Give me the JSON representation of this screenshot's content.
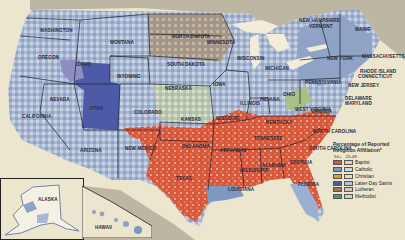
{
  "map": {
    "title": "Religious Affiliation by County",
    "states": [
      {
        "name": "WASHINGTON",
        "x": 40,
        "y": 28
      },
      {
        "name": "OREGON",
        "x": 38,
        "y": 55
      },
      {
        "name": "MONTANA",
        "x": 110,
        "y": 40
      },
      {
        "name": "IDAHO",
        "x": 76,
        "y": 62
      },
      {
        "name": "WYOMING",
        "x": 117,
        "y": 74
      },
      {
        "name": "NEVADA",
        "x": 50,
        "y": 97
      },
      {
        "name": "UTAH",
        "x": 90,
        "y": 106
      },
      {
        "name": "CALIFORNIA",
        "x": 22,
        "y": 114
      },
      {
        "name": "COLORADO",
        "x": 134,
        "y": 110
      },
      {
        "name": "ARIZONA",
        "x": 80,
        "y": 148
      },
      {
        "name": "NEW MEXICO",
        "x": 125,
        "y": 146
      },
      {
        "name": "NORTH DAKOTA",
        "x": 172,
        "y": 34
      },
      {
        "name": "SOUTH DAKOTA",
        "x": 167,
        "y": 62
      },
      {
        "name": "NEBRASKA",
        "x": 165,
        "y": 86
      },
      {
        "name": "KANSAS",
        "x": 181,
        "y": 117
      },
      {
        "name": "OKLAHOMA",
        "x": 182,
        "y": 144
      },
      {
        "name": "TEXAS",
        "x": 176,
        "y": 176
      },
      {
        "name": "MINNESOTA",
        "x": 207,
        "y": 40
      },
      {
        "name": "IOWA",
        "x": 213,
        "y": 82
      },
      {
        "name": "MISSOURI",
        "x": 216,
        "y": 116
      },
      {
        "name": "ARKANSAS",
        "x": 220,
        "y": 148
      },
      {
        "name": "LOUISIANA",
        "x": 228,
        "y": 187
      },
      {
        "name": "WISCONSIN",
        "x": 237,
        "y": 56
      },
      {
        "name": "ILLINOIS",
        "x": 240,
        "y": 101
      },
      {
        "name": "MICHIGAN",
        "x": 265,
        "y": 66
      },
      {
        "name": "INDIANA",
        "x": 260,
        "y": 97
      },
      {
        "name": "OHIO",
        "x": 283,
        "y": 92
      },
      {
        "name": "KENTUCKY",
        "x": 266,
        "y": 120
      },
      {
        "name": "TENNESSEE",
        "x": 254,
        "y": 136
      },
      {
        "name": "MISSISSIPPI",
        "x": 240,
        "y": 168
      },
      {
        "name": "ALABAMA",
        "x": 262,
        "y": 163
      },
      {
        "name": "GEORGIA",
        "x": 290,
        "y": 160
      },
      {
        "name": "FLORIDA",
        "x": 298,
        "y": 182
      },
      {
        "name": "WEST VIRGINIA",
        "x": 295,
        "y": 107
      },
      {
        "name": "VIRGINIA",
        "x": 311,
        "y": 109
      },
      {
        "name": "NORTH CAROLINA",
        "x": 313,
        "y": 129
      },
      {
        "name": "SOUTH CAROLINA",
        "x": 309,
        "y": 146
      },
      {
        "name": "PENNSYLVANIA",
        "x": 305,
        "y": 80
      },
      {
        "name": "NEW YORK",
        "x": 327,
        "y": 56
      },
      {
        "name": "NEW JERSEY",
        "x": 348,
        "y": 83
      },
      {
        "name": "DELAWARE",
        "x": 345,
        "y": 96
      },
      {
        "name": "MARYLAND",
        "x": 345,
        "y": 101
      },
      {
        "name": "NEW HAMPSHIRE",
        "x": 299,
        "y": 18
      },
      {
        "name": "VERMONT",
        "x": 309,
        "y": 24
      },
      {
        "name": "MAINE",
        "x": 355,
        "y": 27
      },
      {
        "name": "MASSACHUSETTS",
        "x": 362,
        "y": 54
      },
      {
        "name": "RHODE ISLAND",
        "x": 360,
        "y": 69
      },
      {
        "name": "CONNECTICUT",
        "x": 358,
        "y": 74
      },
      {
        "name": "ALASKA",
        "x": 38,
        "y": 197
      },
      {
        "name": "HAWAII",
        "x": 95,
        "y": 225
      }
    ]
  },
  "legend": {
    "title_line1": "Percentage of Reported",
    "title_line2": "Religious Affiliation*",
    "col_high": "50+",
    "col_low": "25-49",
    "items": [
      {
        "label": "Baptist",
        "high": "#d9553a",
        "low": "#e8c9c0"
      },
      {
        "label": "Catholic",
        "high": "#7f98c0",
        "low": "#ccd6e6"
      },
      {
        "label": "Christian",
        "high": "#e0a030",
        "low": "#eadcb8"
      },
      {
        "label": "Latter-Day Saints",
        "high": "#4c5aa8",
        "low": "#b9bedf"
      },
      {
        "label": "Lutheran",
        "high": "#9b7a5c",
        "low": "#d4c6b6"
      },
      {
        "label": "Methodist",
        "high": "#4f9a72",
        "low": "#c4d6c4"
      }
    ]
  },
  "colors": {
    "ocean": "#ece6cf",
    "canada": "#bdb6a3",
    "baptist": "#d9553a",
    "catholic": "#8da3c8",
    "catholic_light": "#c5d1e4",
    "lds": "#4c5aa8",
    "lutheran": "#a58a6e",
    "methodist": "#aac49a",
    "lakes": "#f2ecd8",
    "border": "#1d1d2a"
  }
}
